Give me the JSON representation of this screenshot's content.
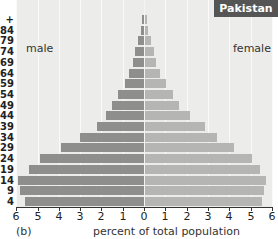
{
  "chart_data": {
    "type": "bar",
    "orientation": "horizontal-population-pyramid",
    "title": "Pakistan",
    "panel_label": "(b)",
    "xlabel": "percent of total population",
    "ylabel": "",
    "xlim": [
      -6,
      6
    ],
    "x_ticks": [
      6,
      5,
      4,
      3,
      2,
      1,
      0,
      1,
      2,
      3,
      4,
      5,
      6
    ],
    "grid": true,
    "legend": {
      "left_label": "male",
      "right_label": "female"
    },
    "categories": [
      "85+",
      "80-84",
      "75-79",
      "70-74",
      "65-69",
      "60-64",
      "55-59",
      "50-54",
      "45-49",
      "40-44",
      "35-39",
      "30-34",
      "25-29",
      "20-24",
      "15-19",
      "10-14",
      "5-9",
      "0-4"
    ],
    "category_labels_visible": [
      "+",
      "84",
      "79",
      "74",
      "69",
      "64",
      "59",
      "54",
      "49",
      "44",
      "39",
      "34",
      "29",
      "24",
      "19",
      "14",
      "9",
      "4"
    ],
    "series": [
      {
        "name": "male",
        "color": "#8e8e8c",
        "values": [
          0.1,
          0.15,
          0.3,
          0.4,
          0.5,
          0.7,
          0.9,
          1.2,
          1.5,
          1.8,
          2.2,
          3.0,
          3.9,
          4.9,
          5.4,
          5.9,
          5.8,
          5.6
        ]
      },
      {
        "name": "female",
        "color": "#b5b5b3",
        "values": [
          0.1,
          0.15,
          0.3,
          0.4,
          0.5,
          0.7,
          1.0,
          1.3,
          1.6,
          2.1,
          2.8,
          3.4,
          4.2,
          5.0,
          5.4,
          5.7,
          5.6,
          5.5
        ]
      }
    ]
  },
  "labels": {
    "country": "Pakistan",
    "male": "male",
    "female": "female",
    "panel": "(b)",
    "xlabel": "percent of total population"
  }
}
